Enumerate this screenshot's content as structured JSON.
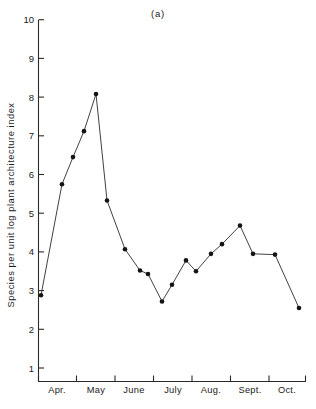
{
  "chart_data": {
    "type": "line",
    "title": "(a)",
    "xlabel": "",
    "ylabel": "Species per unit log plant architecture index",
    "ylim": [
      0,
      10
    ],
    "yticks": [
      1,
      2,
      3,
      4,
      5,
      6,
      7,
      8,
      9,
      10
    ],
    "ytick_labels": [
      "1",
      "2",
      "3",
      "4",
      "5",
      "6",
      "7",
      "8",
      "9",
      "10"
    ],
    "xtick_labels": [
      "Apr.",
      "May",
      "June",
      "July",
      "Aug.",
      "Sept.",
      "Oct."
    ],
    "grid": false,
    "legend": "none",
    "marker": "filled-circle",
    "series": [
      {
        "name": "Species per unit log plant architecture index",
        "x": [
          0.1,
          1.0,
          1.45,
          1.92,
          2.4,
          2.88,
          3.6,
          4.22,
          4.58,
          5.12,
          5.58,
          6.14,
          6.58,
          7.02,
          7.48,
          7.9,
          8.4,
          8.82,
          9.3,
          9.8,
          10.28,
          10.78
        ],
        "values": [
          2.88,
          5.75,
          6.45,
          7.12,
          8.08,
          5.33,
          4.07,
          3.52,
          3.43,
          2.72,
          3.15,
          3.78,
          3.5,
          3.95,
          4.2,
          4.68,
          3.95,
          3.95,
          2.55,
          null,
          null,
          null
        ]
      }
    ],
    "points": [
      {
        "px": 41,
        "value": 2.88
      },
      {
        "px": 62,
        "value": 5.75
      },
      {
        "px": 73,
        "value": 6.45
      },
      {
        "px": 84,
        "value": 7.12
      },
      {
        "px": 96,
        "value": 8.08
      },
      {
        "px": 107,
        "value": 5.33
      },
      {
        "px": 125,
        "value": 4.07
      },
      {
        "px": 140,
        "value": 3.52
      },
      {
        "px": 148,
        "value": 3.43
      },
      {
        "px": 162,
        "value": 2.72
      },
      {
        "px": 172,
        "value": 3.15
      },
      {
        "px": 186,
        "value": 3.78
      },
      {
        "px": 196,
        "value": 3.5
      },
      {
        "px": 211,
        "value": 3.95
      },
      {
        "px": 222,
        "value": 4.2
      },
      {
        "px": 240,
        "value": 4.68
      },
      {
        "px": 253,
        "value": 3.95
      },
      {
        "px": 275,
        "value": 3.93
      },
      {
        "px": 299,
        "value": 2.55
      }
    ]
  },
  "axes": {
    "y_axis_name": "y-axis",
    "x_axis_name": "x-axis"
  }
}
